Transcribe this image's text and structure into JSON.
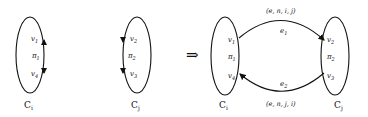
{
  "diagram": {
    "left_clusters": [
      {
        "name": "C",
        "sub": "i",
        "vertices": [
          "v1",
          "π1",
          "v4"
        ],
        "labels": {
          "top": "v",
          "top_sub": "1",
          "mid": "π",
          "mid_sub": "1",
          "bot": "v",
          "bot_sub": "4"
        }
      },
      {
        "name": "C",
        "sub": "j",
        "vertices": [
          "v2",
          "π2",
          "v3"
        ],
        "labels": {
          "top": "v",
          "top_sub": "2",
          "mid": "π",
          "mid_sub": "2",
          "bot": "v",
          "bot_sub": "3"
        }
      }
    ],
    "implies": "⇒",
    "right": {
      "ci": {
        "name": "C",
        "sub": "i",
        "top": "v",
        "top_sub": "1",
        "mid": "π",
        "mid_sub": "1",
        "bot": "v",
        "bot_sub": "4"
      },
      "cj": {
        "name": "C",
        "sub": "j",
        "top": "v",
        "top_sub": "2",
        "mid": "π",
        "mid_sub": "2",
        "bot": "v",
        "bot_sub": "3"
      },
      "edges": [
        {
          "name": "e",
          "sub": "1",
          "tuple": "(e, n, i, j)",
          "from": "v1",
          "to": "v2"
        },
        {
          "name": "e",
          "sub": "2",
          "tuple": "(e, n, j, i)",
          "from": "v3",
          "to": "v4"
        }
      ]
    }
  }
}
